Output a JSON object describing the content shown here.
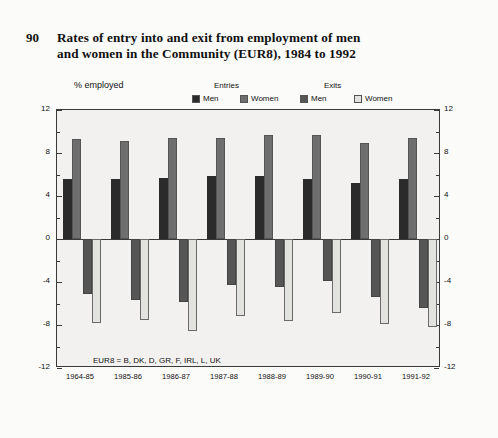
{
  "figure": {
    "number": "90",
    "title_line1": "Rates of entry into and exit from employment of men",
    "title_line2": "and women in the Community (EUR8), 1984 to 1992"
  },
  "legend": {
    "group1_title": "Entries",
    "group2_title": "Exits",
    "items": [
      {
        "label": "Men",
        "color": "#2b2b2b"
      },
      {
        "label": "Women",
        "color": "#6e6e6e"
      },
      {
        "label": "Men",
        "color": "#565656"
      },
      {
        "label": "Women",
        "color": "#e2e2de"
      }
    ]
  },
  "footnote": "EUR8 = B, DK, D, GR, F, IRL, L, UK",
  "chart_data": {
    "type": "bar",
    "title": "Rates of entry into and exit from employment of men and women in the Community (EUR8), 1984 to 1992",
    "xlabel": "",
    "ylabel": "% employed",
    "ylim": [
      -12,
      12
    ],
    "yticks": [
      12,
      8,
      4,
      0,
      -4,
      -8,
      -12
    ],
    "ytick_labels": [
      "12",
      "8",
      "4",
      "0",
      "-4",
      "-8",
      "-12"
    ],
    "grid": false,
    "legend_position": "top",
    "categories": [
      "1964-85",
      "1985-86",
      "1986-87",
      "1987-88",
      "1988-89",
      "1989-90",
      "1990-91",
      "1991-92"
    ],
    "series": [
      {
        "name": "Entries Men",
        "color": "#2b2b2b",
        "values": [
          5.6,
          5.6,
          5.7,
          5.9,
          5.9,
          5.6,
          5.2,
          5.6
        ]
      },
      {
        "name": "Entries Women",
        "color": "#6e6e6e",
        "values": [
          9.3,
          9.1,
          9.4,
          9.4,
          9.7,
          9.7,
          8.9,
          9.4
        ]
      },
      {
        "name": "Exits Men",
        "color": "#565656",
        "values": [
          -5.1,
          -5.7,
          -5.9,
          -4.3,
          -4.5,
          -3.9,
          -5.4,
          -6.4
        ]
      },
      {
        "name": "Exits Women",
        "color": "#e2e2de",
        "values": [
          -7.8,
          -7.5,
          -8.6,
          -7.2,
          -7.6,
          -6.9,
          -7.9,
          -8.2
        ]
      }
    ]
  }
}
